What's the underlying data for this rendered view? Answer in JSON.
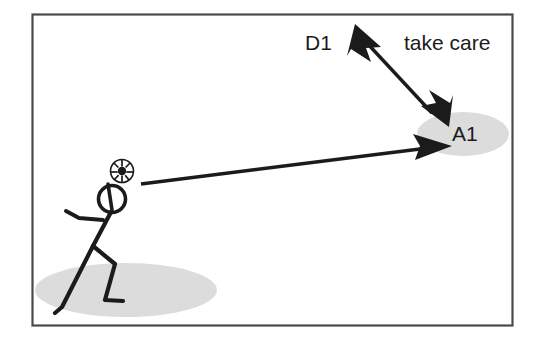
{
  "scene": {
    "title": "take care",
    "kind": "soccer-tactics-diagram",
    "background_color": "#ffffff",
    "frame": {
      "border_color": "#4a4a4a",
      "x": 32,
      "y": 14,
      "width": 481,
      "height": 312
    },
    "colors": {
      "ink": "#1b1b1b",
      "zone_gray": "#dcdcdc",
      "frame": "#4a4a4a",
      "paper": "#ffffff"
    }
  },
  "labels": {
    "defender": "D1",
    "note": "take care",
    "attacker": "A1"
  },
  "label_positions": {
    "defender": {
      "x": 305,
      "y": 50
    },
    "note": {
      "x": 404,
      "y": 50
    },
    "attacker": {
      "x": 452,
      "y": 141
    }
  },
  "zones": [
    {
      "name": "attacker-zone-ellipse",
      "cx": 463,
      "cy": 134,
      "rx": 46,
      "ry": 22,
      "color": "#dcdcdc"
    },
    {
      "name": "player-ground-shadow-ellipse",
      "cx": 126,
      "cy": 290,
      "rx": 91,
      "ry": 27,
      "color": "#dcdcdc"
    }
  ],
  "arrows": [
    {
      "name": "defender-movement-arrow",
      "style": "double-headed",
      "from": {
        "x": 357,
        "y": 31
      },
      "to": {
        "x": 440,
        "y": 122
      },
      "color": "#1b1b1b"
    },
    {
      "name": "pass-arrow",
      "style": "single-headed",
      "from": {
        "x": 141,
        "y": 184
      },
      "to": {
        "x": 447,
        "y": 146
      },
      "color": "#1b1b1b"
    }
  ],
  "player": {
    "name": "stick-figure-player",
    "head": {
      "cx": 112,
      "cy": 199,
      "r": 13.5
    },
    "ball": {
      "cx": 122,
      "cy": 171,
      "r": 11.5,
      "type": "soccer-ball"
    },
    "neck": {
      "x1": 107,
      "y1": 186,
      "x2": 112,
      "y2": 212
    },
    "torso": {
      "x1": 110,
      "y1": 213,
      "x2": 93,
      "y2": 245
    },
    "arm": [
      {
        "x": 101,
        "y": 222
      },
      {
        "x": 78,
        "y": 217
      },
      {
        "x": 67,
        "y": 212
      }
    ],
    "back_leg": [
      {
        "x": 93,
        "y": 245
      },
      {
        "x": 62,
        "y": 308
      },
      {
        "x": 56,
        "y": 312
      }
    ],
    "front_leg": [
      {
        "x": 93,
        "y": 245
      },
      {
        "x": 114,
        "y": 264
      },
      {
        "x": 105,
        "y": 300
      },
      {
        "x": 122,
        "y": 301
      }
    ]
  }
}
